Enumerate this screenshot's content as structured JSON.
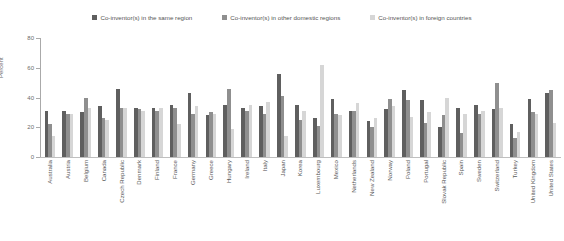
{
  "chart_data": {
    "type": "bar",
    "title": "",
    "xlabel": "",
    "ylabel": "Percent",
    "ylim": [
      0,
      80
    ],
    "yticks": [
      0,
      20,
      40,
      60,
      80
    ],
    "grid": false,
    "legend_position": "top-center",
    "categories": [
      "Australia",
      "Austria",
      "Belgium",
      "Canada",
      "Czech Republic",
      "Denmark",
      "Finland",
      "France",
      "Germany",
      "Greece",
      "Hungary",
      "Ireland",
      "Italy",
      "Japan",
      "Korea",
      "Luxembourg",
      "Mexico",
      "Netherlands",
      "New Zealand",
      "Norway",
      "Poland",
      "Portugal",
      "Slovak Republic",
      "Spain",
      "Sweden",
      "Switzerland",
      "Turkey",
      "United Kingdom",
      "United States"
    ],
    "series": [
      {
        "name": "Co-inventor(s) in the same region",
        "color": "#5f5f5f",
        "values": [
          31,
          31,
          30,
          34,
          46,
          33,
          33,
          35,
          43,
          28,
          35,
          33,
          34,
          56,
          35,
          26,
          39,
          31,
          24,
          32,
          45,
          38,
          20,
          33,
          35,
          32,
          22,
          39,
          43
        ]
      },
      {
        "name": "Co-inventor(s) in other domestic regions",
        "color": "#8f8f8f",
        "values": [
          22,
          29,
          40,
          26,
          33,
          32,
          31,
          33,
          29,
          30,
          46,
          31,
          29,
          41,
          25,
          21,
          29,
          31,
          20,
          39,
          38,
          23,
          28,
          16,
          29,
          50,
          13,
          30,
          45
        ]
      },
      {
        "name": "Co-inventor(s) in foreign countries",
        "color": "#d6d6d6",
        "values": [
          14,
          29,
          33,
          25,
          33,
          31,
          33,
          22,
          34,
          29,
          19,
          35,
          37,
          14,
          31,
          62,
          28,
          36,
          26,
          34,
          27,
          30,
          40,
          29,
          31,
          33,
          17,
          29,
          23
        ]
      }
    ]
  }
}
